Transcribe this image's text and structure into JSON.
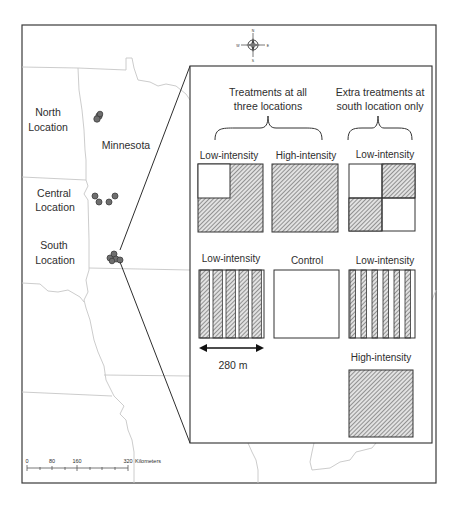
{
  "map": {
    "state_label": "Minnesota",
    "locations": [
      {
        "name": "north",
        "line1": "North",
        "line2": "Location"
      },
      {
        "name": "central",
        "line1": "Central",
        "line2": "Location"
      },
      {
        "name": "south",
        "line1": "South",
        "line2": "Location"
      }
    ],
    "compass": {
      "n": "N",
      "s": "S",
      "e": "E",
      "w": "W"
    },
    "scale_bar": {
      "ticks": [
        "0",
        "80",
        "160",
        "320"
      ],
      "unit": "Kilometers"
    }
  },
  "inset": {
    "group_all": {
      "line1": "Treatments at all",
      "line2": "three locations"
    },
    "group_south": {
      "line1": "Extra treatments at",
      "line2": "south location only"
    },
    "treatments": [
      {
        "id": "a",
        "label": "Low-intensity",
        "pattern": "L-shape-hatched"
      },
      {
        "id": "b",
        "label": "High-intensity",
        "pattern": "fully-hatched"
      },
      {
        "id": "c",
        "label": "Low-intensity",
        "pattern": "checkerboard-hatched"
      },
      {
        "id": "d",
        "label": "Low-intensity",
        "pattern": "wide-strips-hatched"
      },
      {
        "id": "e",
        "label": "Control",
        "pattern": "none"
      },
      {
        "id": "f",
        "label": "Low-intensity",
        "pattern": "narrow-strips-hatched"
      },
      {
        "id": "g",
        "label": "High-intensity",
        "pattern": "fully-hatched"
      }
    ],
    "dimension_label": "280 m"
  },
  "colors": {
    "frame": "#3a3a3a",
    "border": "#c8c8c8",
    "hatch": "#5a5a5a",
    "point": "#6e6e6e"
  }
}
